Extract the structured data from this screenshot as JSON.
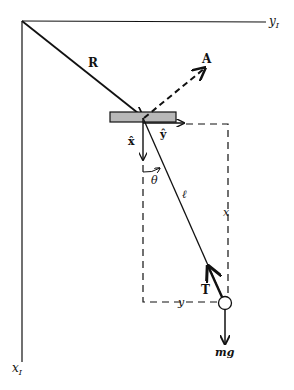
{
  "diagram": {
    "type": "pendulum-on-moving-support free-body diagram",
    "colors": {
      "ink": "#111111",
      "support_fill": "#b8b8b8",
      "background": "#ffffff"
    },
    "axes": {
      "y_inertial": {
        "label": "y",
        "subscript": "I"
      },
      "x_inertial": {
        "label": "x",
        "subscript": "I"
      }
    },
    "vectors": {
      "position": "R",
      "acceleration": "A",
      "tension": "T",
      "weight": "mg",
      "unit_x": "x̂",
      "unit_y": "ŷ"
    },
    "labels": {
      "angle": "θ",
      "length": "ℓ",
      "x_displacement": "x",
      "y_displacement": "y"
    }
  }
}
